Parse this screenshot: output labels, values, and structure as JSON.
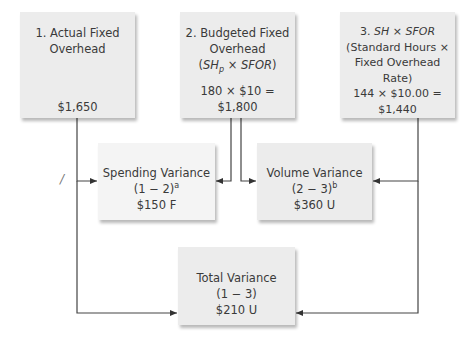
{
  "boxes": {
    "actual": {
      "title_line1": "1. Actual Fixed",
      "title_line2": "Overhead",
      "amount": "$1,650"
    },
    "budgeted": {
      "title_line1": "2. Budgeted Fixed",
      "title_line2": "Overhead",
      "formula_sh": "SH",
      "formula_sub": "p",
      "formula_times": " × ",
      "formula_sfor": "SFOR",
      "calc": "180 × $10 =",
      "amount": "$1,800"
    },
    "applied": {
      "title_num": "3. ",
      "title_sh": "SH",
      "title_times": " × ",
      "title_sfor": "SFOR",
      "desc_line1": "(Standard Hours ×",
      "desc_line2": "Fixed Overhead",
      "desc_line3": "Rate)",
      "calc": "144 × $10.00 =",
      "amount": "$1,440"
    },
    "spending": {
      "title": "Spending Variance",
      "formula": "(1 − 2)",
      "footnote": "a",
      "amount": "$150 F"
    },
    "volume": {
      "title": "Volume Variance",
      "formula": "(2 − 3)",
      "footnote": "b",
      "amount": "$360 U"
    },
    "total": {
      "title": "Total Variance",
      "formula": "(1 − 3)",
      "amount": "$210 U"
    }
  },
  "annotations": {
    "slash_mark": "/"
  }
}
